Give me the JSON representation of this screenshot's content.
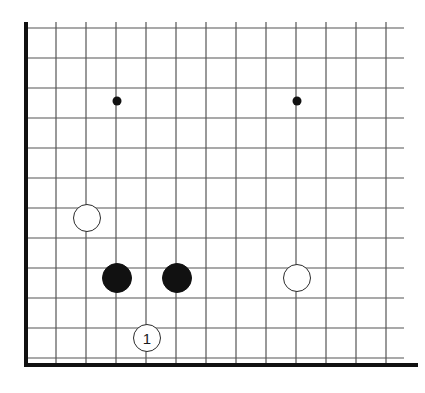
{
  "figure": {
    "width": 425,
    "height": 393,
    "background_color": "#ffffff"
  },
  "board": {
    "grid_spacing": 30,
    "origin_x": 26,
    "origin_y": 28,
    "columns": 13,
    "rows": 12,
    "line_color": "#555555",
    "line_width": 1.2,
    "edge_color": "#111111",
    "edge_width": 4,
    "edges": {
      "left_x": 26,
      "bottom_y": 365,
      "grid_right_x": 404,
      "grid_top_y": 22
    },
    "star_point_color": "#111111",
    "star_point_radius": 4.5,
    "star_points": [
      {
        "name": "star-point-left",
        "x": 117,
        "y": 101
      },
      {
        "name": "star-point-right",
        "x": 297,
        "y": 101
      }
    ]
  },
  "stones": [
    {
      "name": "white-stone-upper-left",
      "color": "white",
      "x": 87,
      "y": 218,
      "radius": 14,
      "label": ""
    },
    {
      "name": "black-stone-left",
      "color": "black",
      "x": 117,
      "y": 278,
      "radius": 15,
      "label": ""
    },
    {
      "name": "black-stone-right",
      "color": "black",
      "x": 177,
      "y": 278,
      "radius": 15,
      "label": ""
    },
    {
      "name": "white-stone-right",
      "color": "white",
      "x": 297,
      "y": 278,
      "radius": 14,
      "label": ""
    },
    {
      "name": "white-stone-move-1",
      "color": "white",
      "x": 147,
      "y": 338,
      "radius": 14,
      "label": "1"
    }
  ],
  "colors": {
    "black_stone": "#111111",
    "white_stone_fill": "#ffffff",
    "white_stone_stroke": "#2b2b2b",
    "grid_line": "#555555",
    "board_edge": "#111111",
    "label_on_white": "#1a1a1a",
    "label_on_black": "#ffffff"
  }
}
